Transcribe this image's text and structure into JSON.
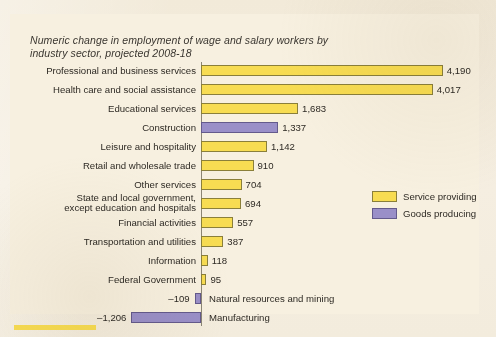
{
  "title": "Numeric change in employment of wage and\nsalary workers by industry sector, projected 2008-18",
  "colors": {
    "service": "#f7dc52",
    "goods": "#9a8fc8",
    "panel_background": "#f7f0e0",
    "page_background": "#f2ead9",
    "axis": "#8b8575",
    "text": "#2e2a24"
  },
  "legend": {
    "items": [
      {
        "label": "Service providing",
        "swatch": "service"
      },
      {
        "label": "Goods producing",
        "swatch": "goods"
      }
    ]
  },
  "chart_data": {
    "type": "bar",
    "orientation": "horizontal",
    "title": "Numeric change in employment of wage and salary workers by industry sector, projected 2008-18",
    "xlabel": "",
    "ylabel": "",
    "xlim": [
      -1400,
      4400
    ],
    "grid": false,
    "legend_position": "right-middle",
    "unit": "thousands of jobs",
    "categories": [
      "Professional and business services",
      "Health care and social assistance",
      "Educational services",
      "Construction",
      "Leisure and hospitality",
      "Retail and wholesale trade",
      "Other services",
      "State and local government,\nexcept education and hospitals",
      "Financial activities",
      "Transportation and utilities",
      "Information",
      "Federal Government",
      "Natural resources and mining",
      "Manufacturing"
    ],
    "values": [
      4190,
      4017,
      1683,
      1337,
      1142,
      910,
      704,
      694,
      557,
      387,
      118,
      95,
      -109,
      -1206
    ],
    "value_labels": [
      "4,190",
      "4,017",
      "1,683",
      "1,337",
      "1,142",
      "910",
      "704",
      "694",
      "557",
      "387",
      "118",
      "95",
      "–109",
      "–1,206"
    ],
    "series": [
      {
        "name": "Service providing",
        "color": "#f7dc52",
        "members": [
          "Professional and business services",
          "Health care and social assistance",
          "Educational services",
          "Leisure and hospitality",
          "Retail and wholesale trade",
          "Other services",
          "State and local government, except education and hospitals",
          "Financial activities",
          "Transportation and utilities",
          "Information",
          "Federal Government"
        ]
      },
      {
        "name": "Goods producing",
        "color": "#9a8fc8",
        "members": [
          "Construction",
          "Natural resources and mining",
          "Manufacturing"
        ]
      }
    ],
    "bars": [
      {
        "category": "Professional and business services",
        "value": 4190,
        "label": "4,190",
        "group": "service",
        "label_side": "right"
      },
      {
        "category": "Health care and social assistance",
        "value": 4017,
        "label": "4,017",
        "group": "service",
        "label_side": "right"
      },
      {
        "category": "Educational services",
        "value": 1683,
        "label": "1,683",
        "group": "service",
        "label_side": "right"
      },
      {
        "category": "Construction",
        "value": 1337,
        "label": "1,337",
        "group": "goods",
        "label_side": "right"
      },
      {
        "category": "Leisure and hospitality",
        "value": 1142,
        "label": "1,142",
        "group": "service",
        "label_side": "right"
      },
      {
        "category": "Retail and wholesale trade",
        "value": 910,
        "label": "910",
        "group": "service",
        "label_side": "right"
      },
      {
        "category": "Other services",
        "value": 704,
        "label": "704",
        "group": "service",
        "label_side": "right"
      },
      {
        "category": "State and local government,\nexcept education and hospitals",
        "value": 694,
        "label": "694",
        "group": "service",
        "label_side": "right"
      },
      {
        "category": "Financial activities",
        "value": 557,
        "label": "557",
        "group": "service",
        "label_side": "right"
      },
      {
        "category": "Transportation and utilities",
        "value": 387,
        "label": "387",
        "group": "service",
        "label_side": "right"
      },
      {
        "category": "Information",
        "value": 118,
        "label": "118",
        "group": "service",
        "label_side": "right"
      },
      {
        "category": "Federal Government",
        "value": 95,
        "label": "95",
        "group": "service",
        "label_side": "right"
      },
      {
        "category": "Natural resources and mining",
        "value": -109,
        "label": "–109",
        "group": "goods",
        "label_side": "left"
      },
      {
        "category": "Manufacturing",
        "value": -1206,
        "label": "–1,206",
        "group": "goods",
        "label_side": "left"
      }
    ]
  }
}
